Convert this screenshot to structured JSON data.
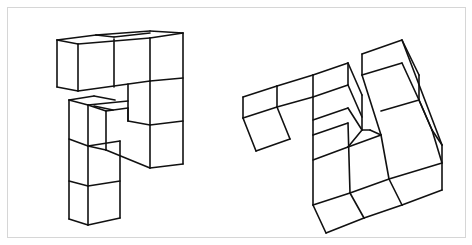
{
  "figure": {
    "type": "mental-rotation-pair",
    "frame_color": "#d6d6d6",
    "line_color": "#111111",
    "panels": [
      {
        "id": "left-object",
        "lines": [
          [
            57,
            40,
            78,
            44
          ],
          [
            78,
            44,
            150,
            38
          ],
          [
            150,
            38,
            183,
            33
          ],
          [
            57,
            40,
            96,
            35
          ],
          [
            96,
            35,
            150,
            31
          ],
          [
            150,
            31,
            183,
            33
          ],
          [
            96,
            35,
            114,
            37
          ],
          [
            114,
            37,
            150,
            33
          ],
          [
            57,
            40,
            57,
            87
          ],
          [
            57,
            87,
            78,
            91
          ],
          [
            78,
            44,
            78,
            91
          ],
          [
            114,
            39,
            114,
            87
          ],
          [
            150,
            38,
            150,
            81
          ],
          [
            183,
            33,
            183,
            164
          ],
          [
            78,
            91,
            150,
            81
          ],
          [
            150,
            81,
            183,
            78
          ],
          [
            128,
            84,
            128,
            121
          ],
          [
            150,
            81,
            150,
            168
          ],
          [
            128,
            121,
            150,
            125
          ],
          [
            150,
            125,
            183,
            121
          ],
          [
            150,
            168,
            183,
            164
          ],
          [
            69,
            100,
            94,
            96
          ],
          [
            94,
            96,
            115,
            100
          ],
          [
            69,
            100,
            88,
            105
          ],
          [
            88,
            105,
            128,
            101
          ],
          [
            88,
            105,
            106,
            111
          ],
          [
            106,
            111,
            128,
            108
          ],
          [
            94,
            106,
            113,
            110
          ],
          [
            69,
            100,
            69,
            219
          ],
          [
            88,
            105,
            88,
            225
          ],
          [
            106,
            111,
            106,
            150
          ],
          [
            69,
            139,
            88,
            146
          ],
          [
            88,
            146,
            120,
            141
          ],
          [
            106,
            150,
            150,
            168
          ],
          [
            88,
            146,
            106,
            150
          ],
          [
            120,
            141,
            120,
            218
          ],
          [
            69,
            181,
            88,
            186
          ],
          [
            88,
            186,
            120,
            181
          ],
          [
            69,
            219,
            88,
            225
          ],
          [
            88,
            225,
            120,
            218
          ],
          [
            128,
            108,
            128,
            121
          ]
        ]
      },
      {
        "id": "right-object",
        "lines": [
          [
            243,
            97,
            277,
            86
          ],
          [
            277,
            86,
            313,
            75
          ],
          [
            313,
            75,
            348,
            63
          ],
          [
            243,
            97,
            243,
            118
          ],
          [
            243,
            118,
            277,
            107
          ],
          [
            277,
            107,
            313,
            97
          ],
          [
            313,
            97,
            348,
            85
          ],
          [
            277,
            86,
            277,
            107
          ],
          [
            313,
            75,
            313,
            135
          ],
          [
            243,
            118,
            256,
            151
          ],
          [
            256,
            151,
            290,
            139
          ],
          [
            277,
            107,
            290,
            139
          ],
          [
            348,
            63,
            362,
            95
          ],
          [
            362,
            95,
            362,
            130
          ],
          [
            348,
            63,
            348,
            85
          ],
          [
            348,
            85,
            362,
            117
          ],
          [
            313,
            120,
            348,
            108
          ],
          [
            348,
            108,
            362,
            130
          ],
          [
            313,
            135,
            313,
            205
          ],
          [
            313,
            135,
            348,
            123
          ],
          [
            313,
            160,
            348,
            147
          ],
          [
            348,
            147,
            381,
            135
          ],
          [
            313,
            205,
            326,
            233
          ],
          [
            326,
            233,
            364,
            218
          ],
          [
            364,
            218,
            402,
            205
          ],
          [
            402,
            205,
            442,
            190
          ],
          [
            313,
            205,
            350,
            193
          ],
          [
            350,
            193,
            389,
            179
          ],
          [
            389,
            179,
            442,
            163
          ],
          [
            350,
            193,
            364,
            218
          ],
          [
            389,
            179,
            402,
            205
          ],
          [
            348,
            123,
            350,
            193
          ],
          [
            348,
            147,
            362,
            130
          ],
          [
            362,
            130,
            370,
            130
          ],
          [
            370,
            130,
            381,
            135
          ],
          [
            381,
            135,
            389,
            179
          ],
          [
            362,
            54,
            402,
            40
          ],
          [
            402,
            40,
            419,
            75
          ],
          [
            362,
            54,
            362,
            75
          ],
          [
            362,
            75,
            402,
            63
          ],
          [
            362,
            75,
            381,
            135
          ],
          [
            402,
            63,
            419,
            100
          ],
          [
            419,
            75,
            419,
            100
          ],
          [
            381,
            111,
            419,
            100
          ],
          [
            419,
            100,
            432,
            130
          ],
          [
            432,
            130,
            442,
            163
          ],
          [
            432,
            130,
            442,
            145
          ],
          [
            442,
            145,
            442,
            190
          ],
          [
            419,
            100,
            432,
            130
          ],
          [
            402,
            40,
            442,
            145
          ]
        ]
      }
    ]
  }
}
